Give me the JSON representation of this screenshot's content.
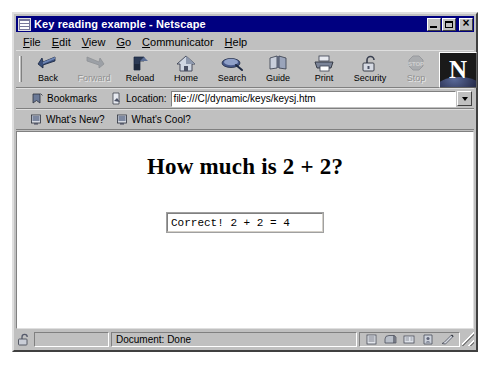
{
  "window": {
    "title": "Key reading example - Netscape",
    "title_icon": "netscape-document-icon",
    "controls": {
      "minimize": "minimize-button",
      "maximize": "maximize-button",
      "close": "close-button"
    }
  },
  "menu": {
    "items": [
      {
        "label": "File",
        "accel": "F"
      },
      {
        "label": "Edit",
        "accel": "E"
      },
      {
        "label": "View",
        "accel": "V"
      },
      {
        "label": "Go",
        "accel": "G"
      },
      {
        "label": "Communicator",
        "accel": "C"
      },
      {
        "label": "Help",
        "accel": "H"
      }
    ]
  },
  "navigation_toolbar": {
    "buttons": [
      {
        "label": "Back",
        "icon": "back-arrow-icon",
        "disabled": false
      },
      {
        "label": "Forward",
        "icon": "forward-arrow-icon",
        "disabled": true
      },
      {
        "label": "Reload",
        "icon": "reload-icon",
        "disabled": false
      },
      {
        "label": "Home",
        "icon": "home-icon",
        "disabled": false
      },
      {
        "label": "Search",
        "icon": "search-icon",
        "disabled": false
      },
      {
        "label": "Guide",
        "icon": "guide-icon",
        "disabled": false
      },
      {
        "label": "Print",
        "icon": "print-icon",
        "disabled": false
      },
      {
        "label": "Security",
        "icon": "security-lock-icon",
        "disabled": false
      },
      {
        "label": "Stop",
        "icon": "stop-sign-icon",
        "disabled": true
      }
    ],
    "logo": {
      "letter": "N",
      "name": "netscape-logo"
    }
  },
  "location_toolbar": {
    "bookmarks_label": "Bookmarks",
    "bookmarks_icon": "bookmark-icon",
    "location_label": "Location:",
    "location_icon": "page-pointer-icon",
    "url": "file:///C|/dynamic/keys/keysj.htm",
    "url_placeholder": "Enter URL",
    "dropdown_icon": "chevron-down-icon"
  },
  "personal_toolbar": {
    "items": [
      {
        "label": "What's New?",
        "icon": "bookmark-page-icon"
      },
      {
        "label": "What's Cool?",
        "icon": "bookmark-page-icon"
      }
    ]
  },
  "page": {
    "heading": "How much is 2 + 2?",
    "answer_field": {
      "value": "Correct!  2 + 2 = 4",
      "placeholder": ""
    },
    "background_color": "#ffffff",
    "text_color": "#000000"
  },
  "status_bar": {
    "message": "Document: Done",
    "lock_icon": "unlocked-padlock-icon",
    "tray_icons": [
      "list-panel-icon",
      "mailbox-icon",
      "newsgroup-icon",
      "address-book-icon",
      "composer-icon"
    ],
    "resize_grip": "resize-grip-icon"
  },
  "colors": {
    "title_bar": "#000080",
    "window_face": "#c0c0c0",
    "content_background": "#ffffff",
    "title_text": "#ffffff",
    "disabled_text": "#909090"
  }
}
